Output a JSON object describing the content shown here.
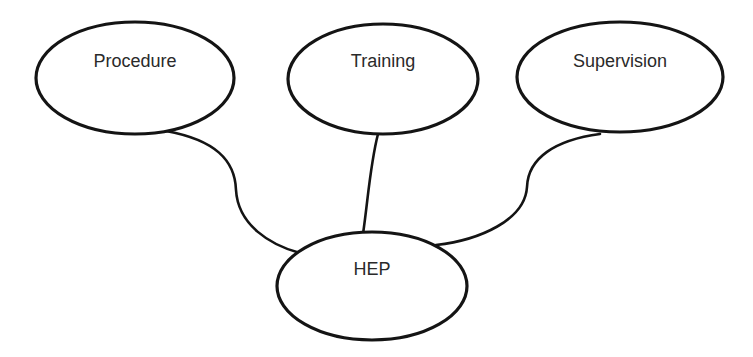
{
  "diagram": {
    "type": "influence-diagram",
    "colors": {
      "stroke": "#141414",
      "text": "#2a2a2a",
      "fill": "#ffffff",
      "background": "#ffffff"
    },
    "nodes": [
      {
        "id": "procedure",
        "label": "Procedure"
      },
      {
        "id": "training",
        "label": "Training"
      },
      {
        "id": "supervision",
        "label": "Supervision"
      },
      {
        "id": "hep",
        "label": "HEP"
      }
    ],
    "edges": [
      {
        "from": "procedure",
        "to": "hep"
      },
      {
        "from": "training",
        "to": "hep"
      },
      {
        "from": "supervision",
        "to": "hep"
      }
    ]
  }
}
